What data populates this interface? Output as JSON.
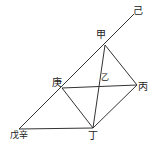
{
  "diagram": {
    "type": "geometric-construction",
    "points": {
      "ji": {
        "label": "己",
        "x": 134,
        "y": 14
      },
      "jia": {
        "label": "甲",
        "x": 105,
        "y": 45
      },
      "geng": {
        "label": "庚",
        "x": 62,
        "y": 88
      },
      "yi": {
        "label": "乙",
        "x": 100,
        "y": 86
      },
      "bing": {
        "label": "丙",
        "x": 137,
        "y": 85
      },
      "ding": {
        "label": "丁",
        "x": 93,
        "y": 128
      },
      "wuxin": {
        "label": "戊辛",
        "x": 19,
        "y": 129
      }
    },
    "labels": [
      {
        "key": "ji",
        "text": "己",
        "x": 136,
        "y": 12
      },
      {
        "key": "jia",
        "text": "甲",
        "x": 96,
        "y": 33
      },
      {
        "key": "geng",
        "text": "庚",
        "x": 51,
        "y": 79
      },
      {
        "key": "yi",
        "text": "乙",
        "x": 102,
        "y": 76
      },
      {
        "key": "bing",
        "text": "丙",
        "x": 139,
        "y": 84
      },
      {
        "key": "ding",
        "text": "丁",
        "x": 89,
        "y": 131
      },
      {
        "key": "wuxin",
        "text": "戊辛",
        "x": 10,
        "y": 131
      }
    ],
    "segments": [
      [
        "wuxin",
        "ji"
      ],
      [
        "wuxin",
        "ding"
      ],
      [
        "geng",
        "bing"
      ],
      [
        "geng",
        "ding"
      ],
      [
        "jia",
        "ding"
      ],
      [
        "jia",
        "bing"
      ],
      [
        "bing",
        "ding"
      ]
    ],
    "stroke_color": "#333333"
  }
}
